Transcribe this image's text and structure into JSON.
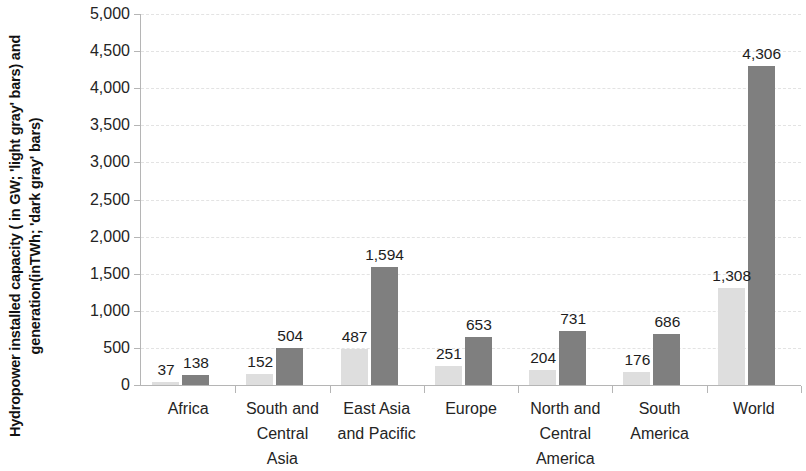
{
  "chart_data": {
    "type": "bar",
    "title": "",
    "subtitle": "",
    "xlabel": "",
    "ylabel": "Hydropower installed capacity ( in GW; 'light gray' bars) and generation(inTWh; 'dark gray' bars)",
    "ylim": [
      0,
      5000
    ],
    "y_tick_step": 500,
    "y_ticks": [
      "0",
      "500",
      "1,000",
      "1,500",
      "2,000",
      "2,500",
      "3,000",
      "3,500",
      "4,000",
      "4,500",
      "5,000"
    ],
    "y_tick_values": [
      0,
      500,
      1000,
      1500,
      2000,
      2500,
      3000,
      3500,
      4000,
      4500,
      5000
    ],
    "grid": true,
    "grid_axis": "y",
    "legend_position": "none",
    "categories": [
      "Africa",
      "South and Central Asia",
      "East Asia and Pacific",
      "Europe",
      "North and Central America",
      "South America",
      "World"
    ],
    "category_lines": [
      [
        "Africa"
      ],
      [
        "South and",
        "Central",
        "Asia"
      ],
      [
        "East Asia",
        "and Pacific"
      ],
      [
        "Europe"
      ],
      [
        "North and",
        "Central",
        "America"
      ],
      [
        "South",
        "America"
      ],
      [
        "World"
      ]
    ],
    "series": [
      {
        "name": "Installed capacity (GW)",
        "color": "#dedede",
        "values": [
          37,
          152,
          487,
          251,
          204,
          176,
          1308
        ],
        "labels": [
          "37",
          "152",
          "487",
          "251",
          "204",
          "176",
          "1,308"
        ]
      },
      {
        "name": "Generation (TWh)",
        "color": "#7f7f7f",
        "values": [
          138,
          504,
          1594,
          653,
          731,
          686,
          4306
        ],
        "labels": [
          "138",
          "504",
          "1,594",
          "653",
          "731",
          "686",
          "4,306"
        ]
      }
    ]
  }
}
